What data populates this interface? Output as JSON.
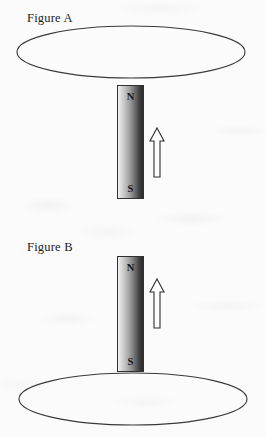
{
  "page": {
    "width": 266,
    "height": 437,
    "background_color": "#fbfbfb",
    "ink_color": "#303030"
  },
  "figures": [
    {
      "id": "figure-a",
      "label": "Figure A",
      "loop": {
        "shape": "ellipse",
        "position": "above-magnet",
        "center_x": 131,
        "center_y": 52,
        "radius_x": 114,
        "radius_y": 26,
        "stroke_color": "#3a3a3a"
      },
      "magnet": {
        "shape": "bar-magnet",
        "top_pole_label": "N",
        "bottom_pole_label": "S",
        "gradient_from": "#f2f2f2",
        "gradient_to": "#2b2b2b",
        "border_color": "#303030"
      },
      "arrow": {
        "direction": "up",
        "label": "",
        "fill_color": "#ffffff",
        "stroke_color": "#2f2f2f"
      }
    },
    {
      "id": "figure-b",
      "label": "Figure B",
      "loop": {
        "shape": "ellipse",
        "position": "below-magnet",
        "center_x": 133,
        "center_y": 399,
        "radius_x": 114,
        "radius_y": 26,
        "stroke_color": "#3a3a3a"
      },
      "magnet": {
        "shape": "bar-magnet",
        "top_pole_label": "N",
        "bottom_pole_label": "S",
        "gradient_from": "#f2f2f2",
        "gradient_to": "#2b2b2b",
        "border_color": "#303030"
      },
      "arrow": {
        "direction": "up",
        "label": "",
        "fill_color": "#ffffff",
        "stroke_color": "#2f2f2f"
      }
    }
  ]
}
